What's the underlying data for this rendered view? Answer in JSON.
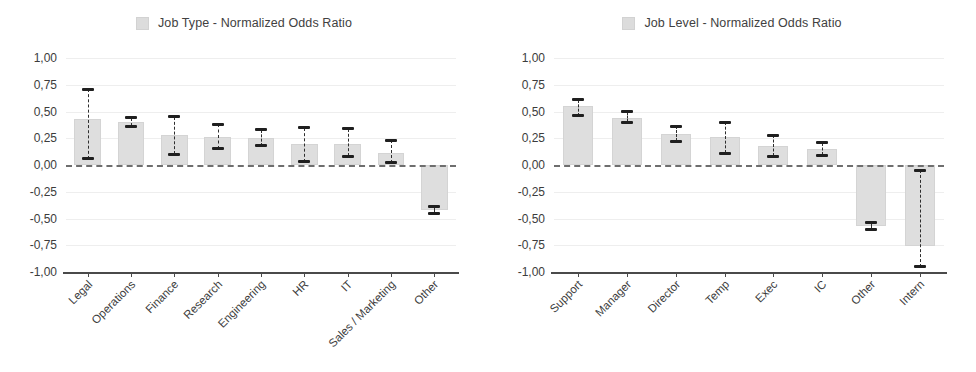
{
  "chart_data": [
    {
      "type": "bar",
      "title": "Job Type - Normalized Odds Ratio",
      "legend_label": "Job Type - Normalized Odds Ratio",
      "legend_position": "top-center",
      "xlabel": "",
      "ylabel": "",
      "ylim": [
        -1.0,
        1.0
      ],
      "ytick_labels": [
        "1,00",
        "0,75",
        "0,50",
        "0,25",
        "0,00",
        "-0,25",
        "-0,50",
        "-0,75",
        "-1,00"
      ],
      "ytick_values": [
        1.0,
        0.75,
        0.5,
        0.25,
        0.0,
        -0.25,
        -0.5,
        -0.75,
        -1.0
      ],
      "grid": true,
      "zero_reference_line": true,
      "bar_color": "#dedede",
      "error_bar_color": "#1f1f1f",
      "categories": [
        "Legal",
        "Operations",
        "Finance",
        "Research",
        "Engineering",
        "HR",
        "IT",
        "Sales / Marketing",
        "Other"
      ],
      "values": [
        0.43,
        0.4,
        0.28,
        0.26,
        0.25,
        0.2,
        0.2,
        0.11,
        -0.42
      ],
      "ci_low": [
        0.06,
        0.36,
        0.1,
        0.15,
        0.18,
        0.03,
        0.08,
        0.02,
        -0.45
      ],
      "ci_high": [
        0.71,
        0.44,
        0.45,
        0.38,
        0.33,
        0.35,
        0.34,
        0.23,
        -0.39
      ]
    },
    {
      "type": "bar",
      "title": "Job Level - Normalized Odds Ratio",
      "legend_label": "Job Level - Normalized Odds Ratio",
      "legend_position": "top-center",
      "xlabel": "",
      "ylabel": "",
      "ylim": [
        -1.0,
        1.0
      ],
      "ytick_labels": [
        "1,00",
        "0,75",
        "0,50",
        "0,25",
        "0,00",
        "-0,25",
        "-0,50",
        "-0,75",
        "-1,00"
      ],
      "ytick_values": [
        1.0,
        0.75,
        0.5,
        0.25,
        0.0,
        -0.25,
        -0.5,
        -0.75,
        -1.0
      ],
      "grid": true,
      "zero_reference_line": true,
      "bar_color": "#dedede",
      "error_bar_color": "#1f1f1f",
      "categories": [
        "Support",
        "Manager",
        "Director",
        "Temp",
        "Exec",
        "IC",
        "Other",
        "Intern"
      ],
      "values": [
        0.55,
        0.44,
        0.29,
        0.26,
        0.18,
        0.15,
        -0.57,
        -0.76
      ],
      "ci_low": [
        0.46,
        0.4,
        0.22,
        0.11,
        0.08,
        0.09,
        -0.6,
        -0.95
      ],
      "ci_high": [
        0.61,
        0.5,
        0.36,
        0.4,
        0.28,
        0.21,
        -0.54,
        -0.05
      ]
    }
  ]
}
